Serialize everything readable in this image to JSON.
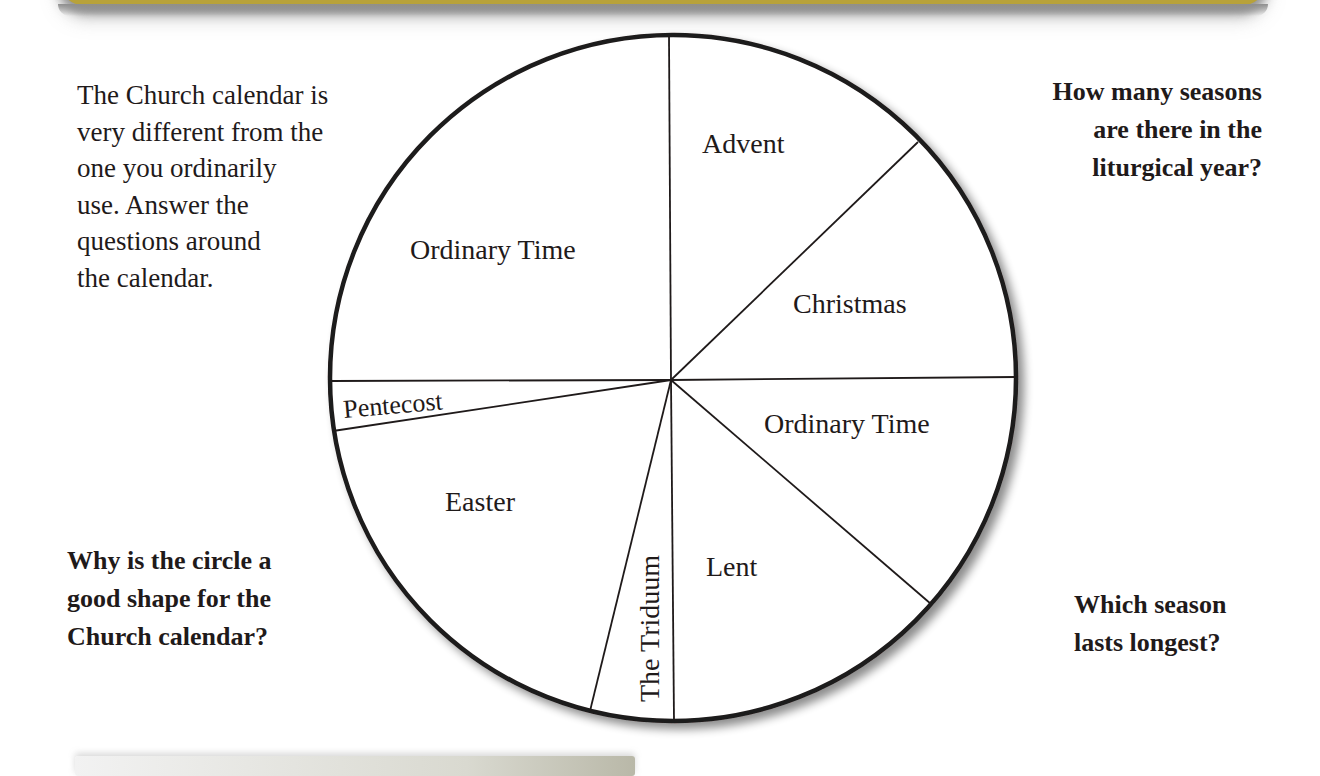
{
  "intro": {
    "lines": [
      "The Church calendar is",
      "very different from the",
      "one you ordinarily",
      "use. Answer the",
      "questions around",
      "the calendar."
    ]
  },
  "questions": {
    "top_right": {
      "lines": [
        "How many seasons",
        "are there in the",
        "liturgical year?"
      ]
    },
    "bottom_left": {
      "lines": [
        "Why is the circle a",
        "good shape for the",
        "Church calendar?"
      ]
    },
    "bottom_right": {
      "lines": [
        "Which season",
        "lasts longest?"
      ]
    }
  },
  "wheel": {
    "title": "Liturgical Year Calendar",
    "segments": [
      {
        "id": "advent",
        "label": "Advent"
      },
      {
        "id": "christmas",
        "label": "Christmas"
      },
      {
        "id": "ordinary-time-1",
        "label": "Ordinary Time"
      },
      {
        "id": "lent",
        "label": "Lent"
      },
      {
        "id": "triduum",
        "label": "The Triduum"
      },
      {
        "id": "easter",
        "label": "Easter"
      },
      {
        "id": "pentecost",
        "label": "Pentecost"
      },
      {
        "id": "ordinary-time-2",
        "label": "Ordinary Time"
      }
    ]
  },
  "colors": {
    "banner": "#b8a23a",
    "ink": "#1f1a1a",
    "background": "#ffffff"
  }
}
